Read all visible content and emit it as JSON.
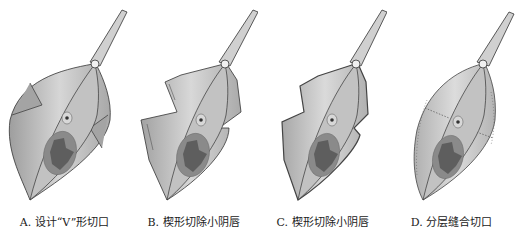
{
  "figure": {
    "panels": [
      {
        "id": "A",
        "caption": "A. 设计“V”形切口",
        "variant": "v-incision"
      },
      {
        "id": "B",
        "caption": "B. 楔形切除小阴唇",
        "variant": "wedge-excision-lines"
      },
      {
        "id": "C",
        "caption": "C. 楔形切除小阴唇",
        "variant": "wedge-excision"
      },
      {
        "id": "D",
        "caption": "D. 分层缝合切口",
        "variant": "layered-suture"
      }
    ],
    "colors": {
      "outline": "#333333",
      "labia_fill": "#c9c9c9",
      "labia_dark": "#9a9a9a",
      "inner_fill": "#b5b5b5",
      "vaginal_fill": "#8a8a8a",
      "vaginal_dark": "#5e5e5e",
      "caption_text": "#222222"
    }
  }
}
